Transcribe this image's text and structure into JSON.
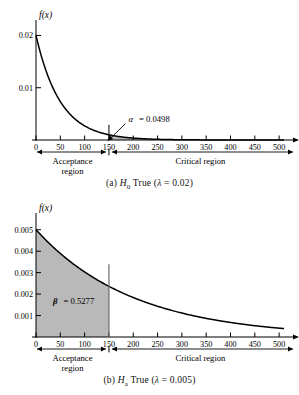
{
  "figure": {
    "background_color": "#ffffff",
    "line_color": "#000000",
    "shade_color": "#b9b9b9"
  },
  "panel_a": {
    "caption_prefix": "(a)",
    "caption_hypothesis": "H",
    "caption_hypothesis_sub": "0",
    "caption_rest": "True (",
    "caption_lambda": "λ",
    "caption_equals": "= 0.02)",
    "y_axis_name": "f(x)",
    "x_axis_name": "x",
    "acceptance_label_line1": "Acceptance",
    "acceptance_label_line2": "region",
    "critical_label": "Critical region",
    "annotation_symbol": "α",
    "annotation_value": "=  0.0498"
  },
  "panel_b": {
    "caption_prefix": "(b)",
    "caption_hypothesis": "H",
    "caption_hypothesis_sub": "a",
    "caption_rest": "True (",
    "caption_lambda": "λ",
    "caption_equals": "= 0.005)",
    "y_axis_name": "f(x)",
    "x_axis_name": "x",
    "acceptance_label_line1": "Acceptance",
    "acceptance_label_line2": "region",
    "critical_label": "Critical region",
    "annotation_symbol": "β",
    "annotation_value": "=  0.5277"
  },
  "chart_data": [
    {
      "type": "area",
      "title": "(a) H0 True (lambda = 0.02)",
      "xlabel": "x",
      "ylabel": "f(x)",
      "curve": "exponential pdf f(x) = lambda * exp(-lambda * x)",
      "lambda": 0.02,
      "xlim": [
        0,
        510
      ],
      "ylim": [
        0,
        0.022
      ],
      "xticks": [
        0,
        50,
        100,
        150,
        200,
        250,
        300,
        350,
        400,
        450,
        500
      ],
      "xticklabels": [
        "0",
        "50",
        "100",
        "150",
        "200",
        "250",
        "300",
        "350",
        "400",
        "450",
        "500"
      ],
      "yticks": [
        0.01,
        0.02
      ],
      "yticklabels": [
        "0.01",
        "0.02"
      ],
      "grid": false,
      "legend": null,
      "critical_value": 150,
      "shaded_region": {
        "from": 150,
        "to": 510,
        "label": "alpha",
        "value": 0.0498
      },
      "annotations": [
        {
          "text": "α  =  0.0498",
          "x": 190,
          "y": 0.0035,
          "leader_to_x": 160,
          "leader_to_y": 0.0006
        }
      ],
      "regions": [
        {
          "label": "Acceptance region",
          "from": 0,
          "to": 150
        },
        {
          "label": "Critical region",
          "from": 150,
          "to": 510
        }
      ],
      "series": [
        {
          "name": "f(x) = 0.02 e^(-0.02 x)",
          "x": [
            0,
            25,
            50,
            75,
            100,
            125,
            150,
            200,
            250,
            300,
            350,
            400,
            450,
            500
          ],
          "values": [
            0.02,
            0.01213,
            0.00736,
            0.00446,
            0.00271,
            0.00164,
            0.000996,
            0.000366,
            0.000135,
            4.96e-05,
            1.82e-05,
            6.7e-06,
            2.5e-06,
            9e-07
          ]
        }
      ]
    },
    {
      "type": "area",
      "title": "(b) Ha True (lambda = 0.005)",
      "xlabel": "x",
      "ylabel": "f(x)",
      "curve": "exponential pdf f(x) = lambda * exp(-lambda * x)",
      "lambda": 0.005,
      "xlim": [
        0,
        510
      ],
      "ylim": [
        0,
        0.0055
      ],
      "xticks": [
        0,
        50,
        100,
        150,
        200,
        250,
        300,
        350,
        400,
        450,
        500
      ],
      "xticklabels": [
        "0",
        "50",
        "100",
        "150",
        "200",
        "250",
        "300",
        "350",
        "400",
        "450",
        "500"
      ],
      "yticks": [
        0.001,
        0.002,
        0.003,
        0.004,
        0.005
      ],
      "yticklabels": [
        "0.001",
        "0.002",
        "0.003",
        "0.004",
        "0.005"
      ],
      "grid": false,
      "legend": null,
      "critical_value": 150,
      "shaded_region": {
        "from": 0,
        "to": 150,
        "label": "beta",
        "value": 0.5277
      },
      "annotations": [
        {
          "text": "β  =  0.5277",
          "x": 35,
          "y": 0.00155
        }
      ],
      "regions": [
        {
          "label": "Acceptance region",
          "from": 0,
          "to": 150
        },
        {
          "label": "Critical region",
          "from": 150,
          "to": 510
        }
      ],
      "series": [
        {
          "name": "f(x) = 0.005 e^(-0.005 x)",
          "x": [
            0,
            50,
            100,
            150,
            200,
            250,
            300,
            350,
            400,
            450,
            500
          ],
          "values": [
            0.005,
            0.003894,
            0.003033,
            0.002362,
            0.00184,
            0.001433,
            0.001116,
            0.000869,
            0.000677,
            0.000527,
            0.00041
          ]
        }
      ]
    }
  ]
}
